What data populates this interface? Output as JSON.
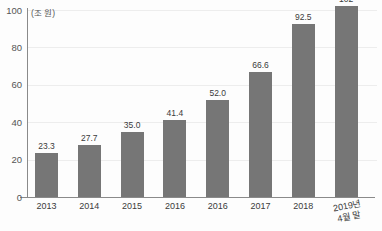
{
  "chart_data": {
    "type": "bar",
    "title": "",
    "subtitle": "",
    "xlabel": "",
    "ylabel": "",
    "unit_label": "(조 원)",
    "categories": [
      "2013",
      "2014",
      "2015",
      "2016",
      "2016",
      "2017",
      "2018",
      "2019년 4월 말"
    ],
    "category_lines": [
      [
        "2013"
      ],
      [
        "2014"
      ],
      [
        "2015"
      ],
      [
        "2016"
      ],
      [
        "2016"
      ],
      [
        "2017"
      ],
      [
        "2018"
      ],
      [
        "2019년",
        "4월 말"
      ]
    ],
    "values": [
      23.3,
      27.7,
      35.0,
      41.4,
      52.0,
      66.6,
      92.5,
      102
    ],
    "value_labels": [
      "23.3",
      "27.7",
      "35.0",
      "41.4",
      "52.0",
      "66.6",
      "92.5",
      "102"
    ],
    "ylim": [
      0,
      100
    ],
    "yticks": [
      0,
      20,
      40,
      60,
      80,
      100
    ],
    "ytick_labels": [
      "0",
      "20",
      "40",
      "60",
      "80",
      "100"
    ],
    "grid": true,
    "legend": "none",
    "bar_color": "#767676",
    "gridline_color": "#ededed",
    "axis_color": "#8a8a8a",
    "background_color": "#fdfdfd",
    "text_color": "#3b3b3b"
  }
}
